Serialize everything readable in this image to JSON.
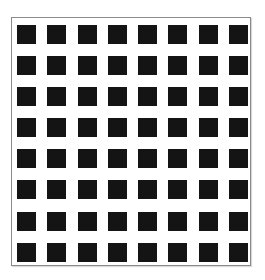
{
  "figure": {
    "type": "square-grid-pattern",
    "rows": 8,
    "columns": 8,
    "square_color": "#141414",
    "background_color": "#ffffff",
    "border_color": "#8a8a8a",
    "cell_count": 64
  }
}
